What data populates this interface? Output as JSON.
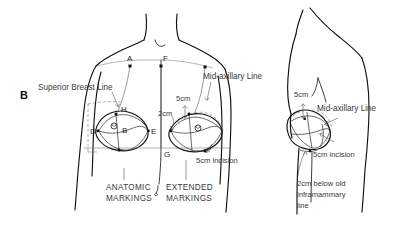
{
  "figure": {
    "panel_letter": "B",
    "background_color": "#ffffff",
    "ink_color": "#111111",
    "text_color": "#3a3a3a"
  },
  "annotations": {
    "superior_breast_line": "Superior Breast Line",
    "mid_axillary_line_front": "Mid-axillary Line",
    "mid_axillary_line_side": "Mid-axillary Line",
    "five_cm_front": "5cm",
    "two_cm_front": "2cm",
    "five_cm_incision_front": "5cm incision",
    "five_cm_side": "5cm",
    "five_cm_incision_side": "5cm incision",
    "below_inframammary_line_1": "2cm below old",
    "below_inframammary_line_2": "inframammary",
    "below_inframammary_line_3": "line"
  },
  "captions": {
    "anatomic_line_1": "ANATOMIC",
    "anatomic_line_2": "MARKINGS",
    "extended_line_1": "EXTENDED",
    "extended_line_2": "MARKINGS"
  },
  "point_labels": {
    "a": "A",
    "b": "B",
    "d": "D",
    "e": "E",
    "f": "F",
    "g": "G",
    "h": "H"
  }
}
